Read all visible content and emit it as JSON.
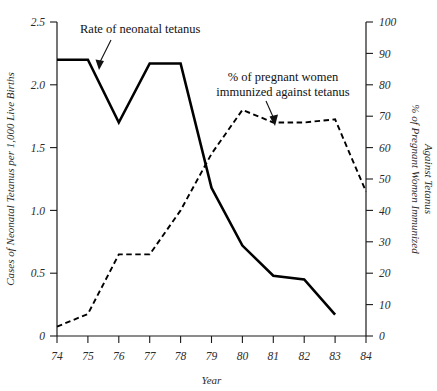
{
  "chart_data": {
    "type": "line",
    "title": "",
    "xlabel": "Year",
    "x": [
      "74",
      "75",
      "76",
      "77",
      "78",
      "79",
      "80",
      "81",
      "82",
      "83",
      "84"
    ],
    "categories": [
      "74",
      "75",
      "76",
      "77",
      "78",
      "79",
      "80",
      "81",
      "82",
      "83",
      "84"
    ],
    "grid": false,
    "legend_position": "inline-annotations",
    "axes": {
      "x": {
        "label": "Year",
        "ticks": [
          "74",
          "75",
          "76",
          "77",
          "78",
          "79",
          "80",
          "81",
          "82",
          "83",
          "84"
        ],
        "range": [
          74,
          84
        ]
      },
      "y_left": {
        "label": "Cases of Neonatal Tetanus per 1,000 Live Births",
        "ticks": [
          "0",
          "0.5",
          "1.0",
          "1.5",
          "2.0",
          "2.5"
        ],
        "tick_values": [
          0,
          0.5,
          1.0,
          1.5,
          2.0,
          2.5
        ],
        "range": [
          0,
          2.5
        ]
      },
      "y_right": {
        "label_line1": "% of Pregnant Women Immunized",
        "label_line2": "Against Tetanus",
        "ticks": [
          "0",
          "10",
          "20",
          "30",
          "40",
          "50",
          "60",
          "70",
          "80",
          "90",
          "100"
        ],
        "tick_values": [
          0,
          10,
          20,
          30,
          40,
          50,
          60,
          70,
          80,
          90,
          100
        ],
        "range": [
          0,
          100
        ]
      }
    },
    "series": [
      {
        "name": "Rate of neonatal tetanus",
        "style": "solid",
        "axis": "left",
        "x": [
          "74",
          "75",
          "76",
          "77",
          "78",
          "79",
          "80",
          "81",
          "82",
          "83"
        ],
        "values": [
          2.2,
          2.2,
          1.7,
          2.17,
          2.17,
          1.18,
          0.72,
          0.48,
          0.45,
          0.17
        ]
      },
      {
        "name": "% of pregnant women immunized against tetanus",
        "style": "dashed",
        "axis": "right",
        "x": [
          "74",
          "75",
          "76",
          "77",
          "78",
          "79",
          "80",
          "81",
          "82",
          "83",
          "84"
        ],
        "values": [
          3,
          7,
          26,
          26,
          40,
          58,
          72,
          68,
          68,
          69,
          46
        ]
      }
    ],
    "annotations": [
      {
        "text": "Rate of neonatal tetanus",
        "target_series": "Rate of neonatal tetanus",
        "points_to_x": "75"
      },
      {
        "text_line1": "% of pregnant women",
        "text_line2": "immunized against tetanus",
        "target_series": "% of pregnant women immunized against tetanus",
        "points_to_x": "81"
      }
    ]
  },
  "annotation1": {
    "line1": "Rate of neonatal tetanus"
  },
  "annotation2": {
    "line1": "% of pregnant women",
    "line2": "immunized against tetanus"
  },
  "x_ticks": {
    "t0": "74",
    "t1": "75",
    "t2": "76",
    "t3": "77",
    "t4": "78",
    "t5": "79",
    "t6": "80",
    "t7": "81",
    "t8": "82",
    "t9": "83",
    "t10": "84"
  },
  "y_left_ticks": {
    "t0": "0",
    "t1": "0.5",
    "t2": "1.0",
    "t3": "1.5",
    "t4": "2.0",
    "t5": "2.5"
  },
  "y_right_ticks": {
    "t0": "0",
    "t1": "10",
    "t2": "20",
    "t3": "30",
    "t4": "40",
    "t5": "50",
    "t6": "60",
    "t7": "70",
    "t8": "80",
    "t9": "90",
    "t10": "100"
  },
  "titles": {
    "x_axis": "Year",
    "y_left": "Cases of Neonatal Tetanus per 1,000 Live Births",
    "y_right_line1": "% of Pregnant Women Immunized",
    "y_right_line2": "Against Tetanus"
  },
  "colors": {
    "ink": "#000000",
    "axis": "#1a1a1a",
    "label": "#2b2b2b"
  }
}
